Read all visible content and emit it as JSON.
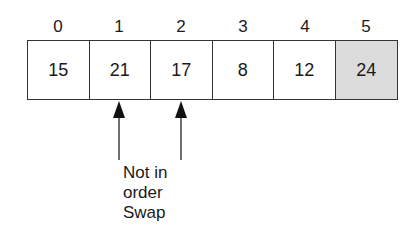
{
  "diagram": {
    "type": "array-bubble-sort-step",
    "indices": [
      "0",
      "1",
      "2",
      "3",
      "4",
      "5"
    ],
    "values": [
      "15",
      "21",
      "17",
      "8",
      "12",
      "24"
    ],
    "highlighted_index": 5,
    "highlight_color": "#dcdcdc",
    "pointers": [
      {
        "target_index": 1
      },
      {
        "target_index": 2
      }
    ],
    "annotation": {
      "line1": "Not in",
      "line2": "order",
      "line3": "Swap"
    }
  }
}
